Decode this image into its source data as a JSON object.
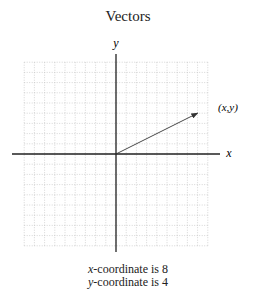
{
  "title": "Vectors",
  "axes": {
    "x_label": "x",
    "y_label": "y"
  },
  "vector": {
    "label": "(x,y)",
    "x": 8,
    "y": 4
  },
  "grid": {
    "x_min": -9,
    "x_max": 9,
    "y_min": -9,
    "y_max": 9,
    "cell_px": 10.2
  },
  "captions": {
    "x_var": "x",
    "x_text": "-coordinate is 8",
    "y_var": "y",
    "y_text": "-coordinate is 4"
  },
  "chart_data": {
    "type": "vector",
    "title": "Vectors",
    "xlabel": "x",
    "ylabel": "y",
    "origin": [
      0,
      0
    ],
    "tip": [
      8,
      4
    ],
    "tip_label": "(x,y)",
    "grid": true
  }
}
